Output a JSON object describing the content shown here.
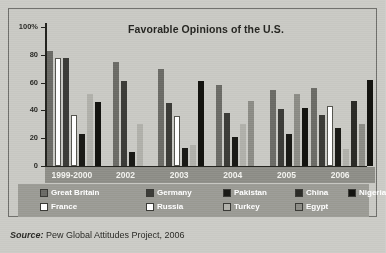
{
  "figure": {
    "source_prefix": "Source:",
    "source_text": " Pew Global Attitudes Project, 2006"
  },
  "chart_data": {
    "type": "bar",
    "title": "Favorable Opinions of the U.S.",
    "xlabel": "",
    "ylabel": "",
    "ylim": [
      0,
      100
    ],
    "yticks": [
      0,
      20,
      40,
      60,
      80,
      100
    ],
    "ytick_labels": [
      "0",
      "20",
      "40",
      "60",
      "80",
      "100%"
    ],
    "grid": false,
    "legend_position": "bottom",
    "categories": [
      "1999-2000",
      "2002",
      "2003",
      "2004",
      "2005",
      "2006"
    ],
    "series": [
      {
        "name": "Great Britain",
        "color": "#6b6b66",
        "values": [
          83,
          75,
          70,
          58,
          55,
          56
        ]
      },
      {
        "name": "France",
        "color": "#ffffff",
        "values": [
          78,
          null,
          null,
          null,
          null,
          null
        ]
      },
      {
        "name": "Germany",
        "color": "#3c3c38",
        "values": [
          78,
          61,
          45,
          38,
          41,
          37
        ]
      },
      {
        "name": "Russia",
        "color": "#ffffff",
        "values": [
          37,
          null,
          36,
          null,
          null,
          43
        ]
      },
      {
        "name": "Pakistan",
        "color": "#1a1a16",
        "values": [
          23,
          10,
          13,
          21,
          23,
          27
        ]
      },
      {
        "name": "Turkey",
        "color": "#b0b0aa",
        "values": [
          52,
          30,
          15,
          30,
          null,
          12
        ]
      },
      {
        "name": "China",
        "color": "#2b2b27",
        "values": [
          null,
          null,
          null,
          null,
          null,
          47
        ]
      },
      {
        "name": "Egypt",
        "color": "#8c8c86",
        "values": [
          null,
          null,
          null,
          47,
          52,
          30
        ]
      },
      {
        "name": "Nigeria",
        "color": "#141410",
        "values": [
          46,
          null,
          61,
          null,
          42,
          62
        ]
      }
    ],
    "legend_row1": [
      {
        "label": "Great Britain",
        "color": "#6b6b66"
      },
      {
        "label": "Germany",
        "color": "#3c3c38"
      },
      {
        "label": "Pakistan",
        "color": "#1a1a16"
      },
      {
        "label": "China",
        "color": "#2b2b27"
      },
      {
        "label": "Nigeria",
        "color": "#141410"
      }
    ],
    "legend_row2": [
      {
        "label": "France",
        "color": "#ffffff"
      },
      {
        "label": "Russia",
        "color": "#ffffff"
      },
      {
        "label": "Turkey",
        "color": "#b0b0aa"
      },
      {
        "label": "Egypt",
        "color": "#8c8c86"
      }
    ]
  }
}
